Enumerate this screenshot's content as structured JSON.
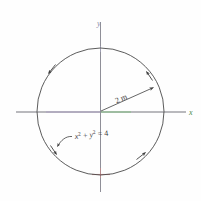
{
  "figure": {
    "type": "geometry-diagram",
    "background_color": "#fefefe"
  },
  "axes": {
    "x_label": "x",
    "y_label": "y",
    "x_label_color": "#4a8a4a",
    "y_label_color": "#8a8aa8",
    "axis_color": "#6b6b70",
    "x_axis_tint_left": "#a89ac4",
    "x_axis_tint_right": "#7ac47a",
    "y_axis_tint_bottom": "#c47a7a",
    "origin": {
      "x": 100.5,
      "y": 111.5
    }
  },
  "circle": {
    "center_x": 100.5,
    "center_y": 111.5,
    "radius_px": 63.5,
    "stroke_color": "#4a4a4a",
    "radius_value": "2 m",
    "equation": "x² + y² = 4"
  },
  "labels": {
    "radius_label": "2 m",
    "equation_label": "x² + y² = 4",
    "equation_base": "x",
    "equation_exp1": "2",
    "equation_plus": " + ",
    "equation_base2": "y",
    "equation_exp2": "2",
    "equation_eq": " = 4"
  },
  "arrows": {
    "radius_arrow_name": "radius-arrow",
    "circumference_arrow_count": 4,
    "circumference_arrows": [
      {
        "name": "arrow-upper-left",
        "angle_deg": 145
      },
      {
        "name": "arrow-upper-right",
        "angle_deg": 40
      },
      {
        "name": "arrow-lower-right",
        "angle_deg": -52
      },
      {
        "name": "arrow-lower-left",
        "angle_deg": -142
      }
    ],
    "leader_line_name": "equation-leader-line"
  }
}
